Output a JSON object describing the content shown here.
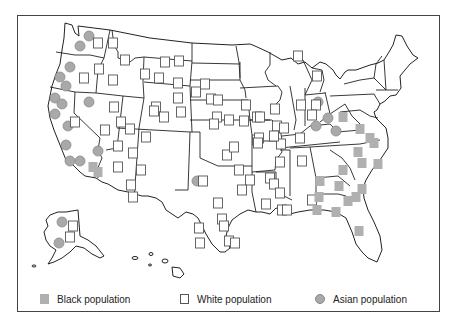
{
  "map": {
    "title": "",
    "region": "United States (including Alaska and Hawaii)",
    "colors": {
      "black_marker": "#b0b0b0",
      "white_marker_fill": "#ffffff",
      "white_marker_stroke": "#555555",
      "asian_marker": "#a9a9a9",
      "state_border": "#222222",
      "frame": "#444444"
    }
  },
  "legend": {
    "items": [
      {
        "key": "black",
        "label": "Black population",
        "symbol": "gray-square"
      },
      {
        "key": "white",
        "label": "White population",
        "symbol": "outlined-square"
      },
      {
        "key": "asian",
        "label": "Asian population",
        "symbol": "gray-circle"
      }
    ]
  },
  "markers": {
    "asian": [
      [
        89,
        36
      ],
      [
        80,
        46
      ],
      [
        70,
        67
      ],
      [
        60,
        77
      ],
      [
        66,
        86
      ],
      [
        55,
        98
      ],
      [
        62,
        104
      ],
      [
        55,
        114
      ],
      [
        89,
        102
      ],
      [
        68,
        126
      ],
      [
        66,
        145
      ],
      [
        70,
        161
      ],
      [
        80,
        161
      ],
      [
        98,
        151
      ],
      [
        62,
        222
      ],
      [
        59,
        243
      ],
      [
        197,
        181
      ],
      [
        318,
        102
      ],
      [
        316,
        126
      ],
      [
        328,
        118
      ],
      [
        336,
        131
      ]
    ],
    "white": [
      [
        98,
        43
      ],
      [
        99,
        69
      ],
      [
        84,
        78
      ],
      [
        75,
        122
      ],
      [
        113,
        43
      ],
      [
        125,
        60
      ],
      [
        113,
        80
      ],
      [
        114,
        107
      ],
      [
        121,
        122
      ],
      [
        130,
        129
      ],
      [
        105,
        130
      ],
      [
        118,
        146
      ],
      [
        118,
        167
      ],
      [
        133,
        153
      ],
      [
        146,
        137
      ],
      [
        141,
        170
      ],
      [
        131,
        185
      ],
      [
        133,
        197
      ],
      [
        165,
        62
      ],
      [
        145,
        74
      ],
      [
        159,
        78
      ],
      [
        179,
        61
      ],
      [
        178,
        83
      ],
      [
        178,
        98
      ],
      [
        156,
        107
      ],
      [
        154,
        111
      ],
      [
        164,
        117
      ],
      [
        181,
        112
      ],
      [
        205,
        84
      ],
      [
        196,
        92
      ],
      [
        211,
        99
      ],
      [
        218,
        100
      ],
      [
        217,
        117
      ],
      [
        214,
        124
      ],
      [
        229,
        120
      ],
      [
        227,
        155
      ],
      [
        244,
        121
      ],
      [
        246,
        105
      ],
      [
        257,
        117
      ],
      [
        260,
        117
      ],
      [
        257,
        140
      ],
      [
        239,
        170
      ],
      [
        250,
        180
      ],
      [
        242,
        190
      ],
      [
        203,
        181
      ],
      [
        218,
        203
      ],
      [
        222,
        219
      ],
      [
        199,
        228
      ],
      [
        200,
        243
      ],
      [
        224,
        226
      ],
      [
        229,
        241
      ],
      [
        235,
        243
      ],
      [
        259,
        138
      ],
      [
        281,
        144
      ],
      [
        280,
        162
      ],
      [
        270,
        178
      ],
      [
        274,
        184
      ],
      [
        266,
        204
      ],
      [
        280,
        193
      ],
      [
        282,
        210
      ],
      [
        298,
        56
      ],
      [
        317,
        76
      ],
      [
        301,
        105
      ],
      [
        316,
        105
      ],
      [
        312,
        115
      ],
      [
        275,
        109
      ],
      [
        277,
        126
      ],
      [
        284,
        128
      ],
      [
        274,
        136
      ],
      [
        234,
        147
      ],
      [
        258,
        143
      ],
      [
        300,
        138
      ],
      [
        302,
        161
      ],
      [
        287,
        210
      ],
      [
        312,
        200
      ],
      [
        73,
        226
      ],
      [
        70,
        237
      ]
    ],
    "black": [
      [
        93,
        167
      ],
      [
        98,
        172
      ],
      [
        343,
        117
      ],
      [
        360,
        129
      ],
      [
        370,
        138
      ],
      [
        374,
        143
      ],
      [
        358,
        152
      ],
      [
        362,
        163
      ],
      [
        378,
        164
      ],
      [
        343,
        170
      ],
      [
        320,
        181
      ],
      [
        339,
        186
      ],
      [
        362,
        189
      ],
      [
        356,
        197
      ],
      [
        319,
        197
      ],
      [
        348,
        201
      ],
      [
        317,
        210
      ],
      [
        336,
        212
      ],
      [
        359,
        231
      ]
    ]
  }
}
